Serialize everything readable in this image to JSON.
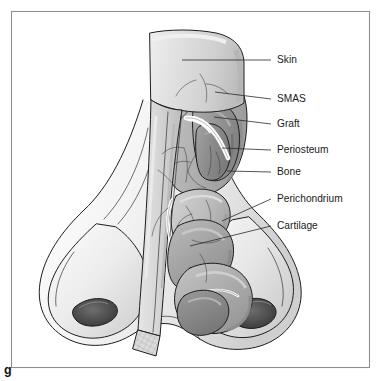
{
  "figure": {
    "letter": "g",
    "type": "anatomical-illustration",
    "style": "grayscale-line-and-tone",
    "border_color": "#8d8f92",
    "background_color": "#ffffff",
    "ink_color": "#1d1d1d"
  },
  "labels": [
    {
      "id": "skin",
      "text": "Skin",
      "text_x": 277,
      "text_y": 60,
      "leader": "M182,60 L271,60",
      "leader_kind": "horizontal"
    },
    {
      "id": "smas",
      "text": "SMAS",
      "text_x": 277,
      "text_y": 99,
      "leader": "M215,92 L271,99",
      "leader_kind": "angled"
    },
    {
      "id": "graft",
      "text": "Graft",
      "text_x": 277,
      "text_y": 124,
      "leader": "M214,117 L271,124",
      "leader_kind": "angled"
    },
    {
      "id": "periosteum",
      "text": "Periosteum",
      "text_x": 277,
      "text_y": 150,
      "leader": "M222,148 L271,150",
      "leader_kind": "horizontal"
    },
    {
      "id": "bone",
      "text": "Bone",
      "text_x": 277,
      "text_y": 172,
      "leader": "M227,171 L271,172",
      "leader_kind": "horizontal"
    },
    {
      "id": "perichondrium",
      "text": "Perichondrium",
      "text_x": 277,
      "text_y": 199,
      "leader": "M222,221 L271,199",
      "leader_kind": "diagonal"
    },
    {
      "id": "cartilage",
      "text": "Cartilage",
      "text_x": 277,
      "text_y": 226,
      "leader": "M190,246 L271,226",
      "leader_kind": "diagonal"
    }
  ],
  "anatomy_regions": [
    {
      "id": "skin-flap",
      "name": "Elevated skin flap",
      "tone": "#dcdcdc"
    },
    {
      "id": "smas-layer",
      "name": "SMAS layer",
      "tone": "#b4b4b4"
    },
    {
      "id": "graft-band",
      "name": "Graft",
      "tone": "#fdfdfd"
    },
    {
      "id": "periosteum",
      "name": "Periosteum",
      "tone": "#9a9a9a"
    },
    {
      "id": "nasal-bone",
      "name": "Nasal bone",
      "tone": "#8c8c8c"
    },
    {
      "id": "perichondrium",
      "name": "Perichondrium",
      "tone": "#c2c2c2"
    },
    {
      "id": "upper-lateral-cartilage",
      "name": "Upper lateral cartilage",
      "tone": "#a8a8a8"
    },
    {
      "id": "lower-lateral-cartilage",
      "name": "Lower lateral cartilage",
      "tone": "#b0b0b0"
    },
    {
      "id": "nasal-dorsum",
      "name": "Nasal dorsum / ala",
      "tone": "#f1f1f1"
    },
    {
      "id": "nostril-left",
      "name": "Left nostril",
      "tone": "#4b4b4b"
    },
    {
      "id": "nostril-right",
      "name": "Right nostril",
      "tone": "#4b4b4b"
    },
    {
      "id": "cut-edge-hatch",
      "name": "Cut edge hatching",
      "tone": "#d2d2d2"
    }
  ]
}
